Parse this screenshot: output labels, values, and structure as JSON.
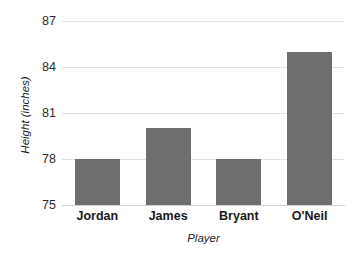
{
  "chart_data": {
    "type": "bar",
    "title": "",
    "categories": [
      "Jordan",
      "James",
      "Bryant",
      "O'Neil"
    ],
    "values": [
      78,
      80,
      78,
      85
    ],
    "xlabel": "Player",
    "ylabel": "Height (inches)",
    "ylim": [
      75,
      87
    ],
    "yticks": [
      75,
      78,
      81,
      84,
      87
    ],
    "ytick_labels": [
      "75",
      "78",
      "81",
      "84",
      "87"
    ],
    "grid": "horizontal",
    "legend": "none",
    "bar_color": "#6e6e6e",
    "gridline_color": "#e2e2e2",
    "background_color": "#ffffff"
  }
}
